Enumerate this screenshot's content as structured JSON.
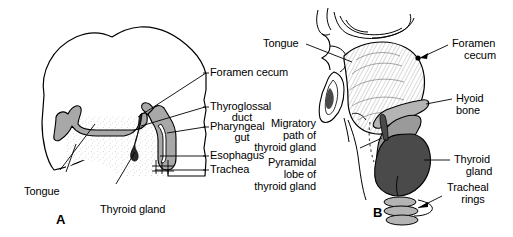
{
  "figure": {
    "panels": [
      {
        "id": "A",
        "id_label": "A",
        "description": "Sagittal section of embryonic head showing thyroid gland origin at the foramen cecum of the tongue",
        "labels": [
          {
            "name": "foramen-cecum",
            "text": "Foramen cecum"
          },
          {
            "name": "thyroglossal-duct",
            "text": "Thyroglossal"
          },
          {
            "name": "thyroglossal-duct-line2",
            "text": "duct"
          },
          {
            "name": "pharyngeal-gut",
            "text": "Pharyngeal"
          },
          {
            "name": "pharyngeal-gut-line2",
            "text": "gut"
          },
          {
            "name": "esophagus",
            "text": "Esophagus"
          },
          {
            "name": "trachea",
            "text": "Trachea"
          },
          {
            "name": "tongue",
            "text": "Tongue"
          },
          {
            "name": "thyroid-gland",
            "text": "Thyroid gland"
          }
        ]
      },
      {
        "id": "B",
        "id_label": "B",
        "description": "Adult sagittal section showing descended thyroid gland, hyoid bone, tracheal rings and migratory path",
        "labels": [
          {
            "name": "tongue",
            "text": "Tongue"
          },
          {
            "name": "foramen-cecum",
            "text": "Foramen"
          },
          {
            "name": "foramen-cecum-line2",
            "text": "cecum"
          },
          {
            "name": "hyoid-bone",
            "text": "Hyoid"
          },
          {
            "name": "hyoid-bone-line2",
            "text": "bone"
          },
          {
            "name": "thyroid-gland",
            "text": "Thyroid"
          },
          {
            "name": "thyroid-gland-line2",
            "text": "gland"
          },
          {
            "name": "tracheal-rings",
            "text": "Tracheal"
          },
          {
            "name": "tracheal-rings-line2",
            "text": "rings"
          },
          {
            "name": "migratory-path",
            "text": "Migratory"
          },
          {
            "name": "migratory-path-line2",
            "text": "path of"
          },
          {
            "name": "migratory-path-line3",
            "text": "thyroid gland"
          },
          {
            "name": "pyramidal-lobe",
            "text": "Pyramidal"
          },
          {
            "name": "pyramidal-lobe-line2",
            "text": "lobe of"
          },
          {
            "name": "pyramidal-lobe-line3",
            "text": "thyroid gland"
          }
        ]
      }
    ],
    "colors": {
      "ink": "#000000",
      "background": "#ffffff",
      "epithelium_gray": "#a8a8a8",
      "tissue_light": "#c9c9c9",
      "hyoid_gray": "#b4b4b4",
      "cartilage_gray": "#9a9a9a",
      "thyroid_dark": "#4a4a4a",
      "stipple_gray": "#e8e8e8"
    }
  }
}
